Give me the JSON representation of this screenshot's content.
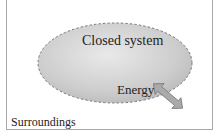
{
  "diagram": {
    "system_label": "Closed system",
    "energy_label": "Energy",
    "surroundings_label": "Surroundings",
    "colors": {
      "system_fill": "#cfcfcf",
      "system_edge": "#777777",
      "arrow_fill": "#aaaaaa",
      "frame": "#a8a8a8"
    }
  }
}
